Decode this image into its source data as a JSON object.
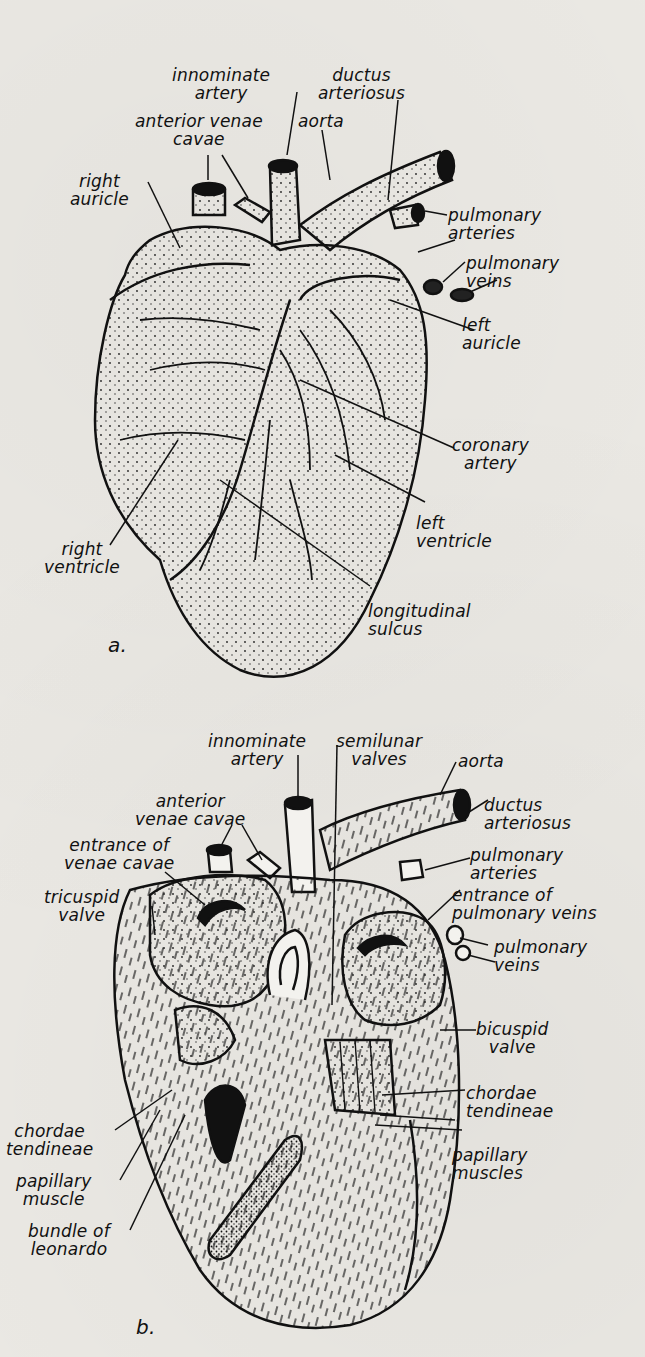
{
  "figure_a": {
    "panel_label": "a.",
    "labels": {
      "innominate_artery": "innominate\nartery",
      "ductus_arteriosus": "ductus\narteriosus",
      "anterior_venae_cavae": "anterior venae\ncavae",
      "aorta": "aorta",
      "right_auricle": "right\nauricle",
      "pulmonary_arteries": "pulmonary\narteries",
      "pulmonary_veins": "pulmonary\nveins",
      "left_auricle": "left\nauricle",
      "coronary_artery": "coronary\nartery",
      "left_ventricle": "left\nventricle",
      "right_ventricle": "right\nventricle",
      "longitudinal_sulcus": "longitudinal\nsulcus"
    }
  },
  "figure_b": {
    "panel_label": "b.",
    "labels": {
      "innominate_artery": "innominate\nartery",
      "semilunar_valves": "semilunar\nvalves",
      "aorta": "aorta",
      "anterior_venae_cavae": "anterior\nvenae cavae",
      "ductus_arteriosus": "ductus\narteriosus",
      "entrance_venae_cavae": "entrance of\nvenae cavae",
      "pulmonary_arteries": "pulmonary\narteries",
      "tricuspid_valve": "tricuspid\nvalve",
      "entrance_pulmonary_veins": "entrance of\npulmonary veins",
      "pulmonary_veins": "pulmonary\nveins",
      "bicuspid_valve": "bicuspid\nvalve",
      "chordae_tendineae_right": "chordae\ntendineae",
      "chordae_tendineae_left": "chordae\ntendineae",
      "papillary_muscles": "papillary\nmuscles",
      "papillary_muscle": "papillary\nmuscle",
      "bundle_of_leonardo": "bundle of\nleonardo"
    }
  }
}
